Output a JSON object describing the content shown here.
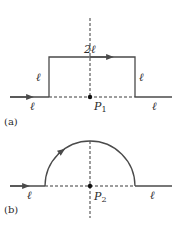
{
  "figure_a": {
    "caption": "(a)",
    "labels": {
      "top": "2ℓ",
      "left_side": "ℓ",
      "right_side": "ℓ",
      "bottom_left": "ℓ",
      "bottom_right": "ℓ",
      "point": "P",
      "point_sub": "1"
    }
  },
  "figure_b": {
    "caption": "(b)",
    "labels": {
      "bottom_left": "ℓ",
      "bottom_right": "ℓ",
      "point": "P",
      "point_sub": "2"
    }
  }
}
